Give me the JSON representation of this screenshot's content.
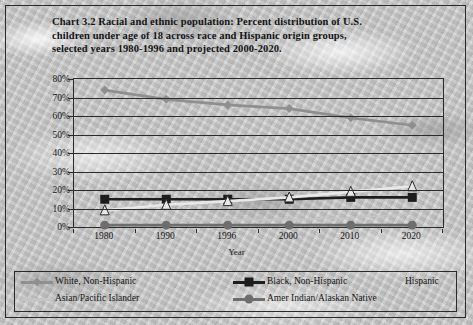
{
  "title": {
    "lines": [
      "Chart 3.2 Racial and ethnic population: Percent distribution of U.S.",
      "children under age of 18 across race and Hispanic origin groups,",
      "selected years 1980-1996 and projected 2000-2020."
    ]
  },
  "axes": {
    "ylabel": "percentage of population",
    "xlabel": "Year",
    "yticks": [
      "0%",
      "10%",
      "20%",
      "30%",
      "40%",
      "50%",
      "60%",
      "70%",
      "80%"
    ]
  },
  "legend": {
    "items": [
      {
        "label": "White, Non-Hispanic",
        "marker": "diamond",
        "color": "#8f8f8f"
      },
      {
        "label": "Black, Non-Hispanic",
        "marker": "square",
        "color": "#1d1d1d"
      },
      {
        "label": "Hispanic",
        "marker": "triangle",
        "color": "#e8e8e8"
      },
      {
        "label": "Asian/Pacific Islander",
        "marker": "none",
        "color": "#c4c4c4"
      },
      {
        "label": "Amer Indian/Alaskan Native",
        "marker": "circle",
        "color": "#6e6e6e"
      }
    ]
  },
  "chart_data": {
    "type": "line",
    "title": "Chart 3.2 Racial and ethnic population: Percent distribution of U.S. children under age of 18 across race and Hispanic origin groups, selected years 1980-1996 and projected 2000-2020.",
    "xlabel": "Year",
    "ylabel": "percentage of population",
    "categories": [
      "1980",
      "1990",
      "1996",
      "2000",
      "2010",
      "2020"
    ],
    "ylim": [
      0,
      80
    ],
    "ytick_step": 10,
    "grid": true,
    "legend_position": "bottom",
    "series": [
      {
        "name": "White, Non-Hispanic",
        "marker": "diamond",
        "color": "#8f8f8f",
        "values": [
          74,
          69,
          66,
          64,
          59,
          55
        ]
      },
      {
        "name": "Black, Non-Hispanic",
        "marker": "square",
        "color": "#1d1d1d",
        "values": [
          15,
          15,
          15,
          15,
          16,
          16
        ]
      },
      {
        "name": "Hispanic",
        "marker": "triangle",
        "color": "#e8e8e8",
        "values": [
          9,
          12,
          14,
          16,
          19,
          22
        ]
      },
      {
        "name": "Asian/Pacific Islander",
        "marker": "none",
        "color": "#c4c4c4",
        "values": [
          2,
          3,
          4,
          4,
          5,
          7
        ]
      },
      {
        "name": "Amer Indian/Alaskan Native",
        "marker": "circle",
        "color": "#6e6e6e",
        "values": [
          1,
          1,
          1,
          1,
          1,
          1
        ]
      }
    ]
  }
}
